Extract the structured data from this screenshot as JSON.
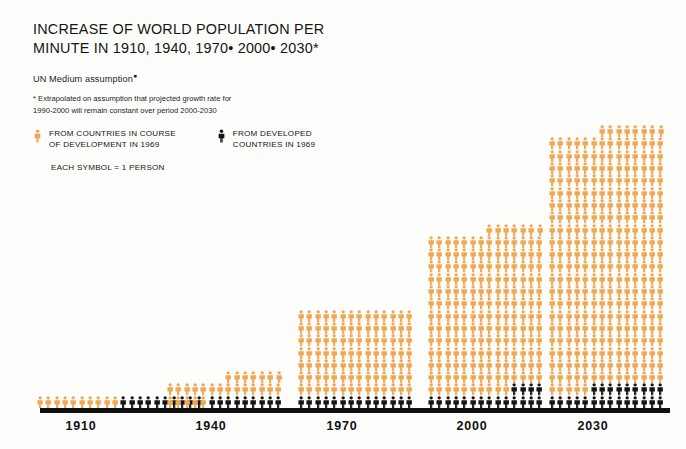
{
  "header": {
    "title": "INCREASE OF WORLD POPULATION PER\nMINUTE IN 1910, 1940, 1970• 2000• 2030*",
    "subtitle": "UN Medium assumption",
    "footnote_line1": "*  Extrapolated on assumption that projected growth rate for",
    "footnote_line2": "1990-2000 will remain constant over period 2000-2030"
  },
  "legend": {
    "developing": {
      "icon": "person-figure-orange-icon",
      "label": "FROM COUNTRIES IN COURSE\nOF DEVELOPMENT IN 1969",
      "color": "#F0A754"
    },
    "developed": {
      "icon": "person-figure-dark-icon",
      "label": "FROM DEVELOPED\nCOUNTRIES IN 1969",
      "color": "#141414"
    },
    "symbol_note": "EACH SYMBOL = 1 PERSON"
  },
  "chart_data": {
    "type": "bar",
    "xlabel": "",
    "ylabel": "PERSONS PER MINUTE (EACH SYMBOL = 1 PERSON)",
    "unit": "persons per minute",
    "symbol_value": 1,
    "categories": [
      "1910",
      "1940",
      "1970",
      "2000",
      "2030"
    ],
    "series": [
      {
        "name": "FROM COUNTRIES IN COURSE OF DEVELOPMENT IN 1969",
        "color": "#F0A754",
        "values": [
          10,
          40,
          98,
          175,
          287
        ]
      },
      {
        "name": "FROM DEVELOPED COUNTRIES IN 1969",
        "color": "#141414",
        "values": [
          10,
          9,
          14,
          18,
          24
        ]
      }
    ],
    "totals": [
      20,
      49,
      112,
      193,
      311
    ],
    "columns_per_group": [
      20,
      14,
      14,
      14,
      14
    ],
    "grid": false,
    "legend_position": "top-left",
    "groups": [
      {
        "label": "1910",
        "cols": 20,
        "rows": [
          {
            "orange": 10,
            "dark": 10,
            "offset": 0
          }
        ]
      },
      {
        "label": "1940",
        "cols": 14,
        "rows": [
          {
            "orange": 7,
            "dark": 0,
            "offset": 7
          },
          {
            "orange": 14,
            "dark": 0,
            "offset": 0
          },
          {
            "orange": 5,
            "dark": 9,
            "offset": 0
          }
        ]
      },
      {
        "label": "1970",
        "cols": 14,
        "rows": [
          {
            "orange": 14,
            "dark": 0,
            "offset": 0
          },
          {
            "orange": 14,
            "dark": 0,
            "offset": 0
          },
          {
            "orange": 14,
            "dark": 0,
            "offset": 0
          },
          {
            "orange": 14,
            "dark": 0,
            "offset": 0
          },
          {
            "orange": 14,
            "dark": 0,
            "offset": 0
          },
          {
            "orange": 14,
            "dark": 0,
            "offset": 0
          },
          {
            "orange": 14,
            "dark": 0,
            "offset": 0
          },
          {
            "orange": 0,
            "dark": 14,
            "offset": 0
          }
        ]
      },
      {
        "label": "2000",
        "cols": 14,
        "rows": [
          {
            "orange": 7,
            "dark": 0,
            "offset": 7
          },
          {
            "orange": 14,
            "dark": 0,
            "offset": 0
          },
          {
            "orange": 14,
            "dark": 0,
            "offset": 0
          },
          {
            "orange": 14,
            "dark": 0,
            "offset": 0
          },
          {
            "orange": 14,
            "dark": 0,
            "offset": 0
          },
          {
            "orange": 14,
            "dark": 0,
            "offset": 0
          },
          {
            "orange": 14,
            "dark": 0,
            "offset": 0
          },
          {
            "orange": 14,
            "dark": 0,
            "offset": 0
          },
          {
            "orange": 14,
            "dark": 0,
            "offset": 0
          },
          {
            "orange": 14,
            "dark": 0,
            "offset": 0
          },
          {
            "orange": 14,
            "dark": 0,
            "offset": 0
          },
          {
            "orange": 14,
            "dark": 0,
            "offset": 0
          },
          {
            "orange": 14,
            "dark": 0,
            "offset": 0
          },
          {
            "orange": 10,
            "dark": 4,
            "offset": 0
          },
          {
            "orange": 0,
            "dark": 14,
            "offset": 0
          }
        ]
      },
      {
        "label": "2030",
        "cols": 14,
        "rows": [
          {
            "orange": 8,
            "dark": 0,
            "offset": 6
          },
          {
            "orange": 14,
            "dark": 0,
            "offset": 0
          },
          {
            "orange": 14,
            "dark": 0,
            "offset": 0
          },
          {
            "orange": 14,
            "dark": 0,
            "offset": 0
          },
          {
            "orange": 14,
            "dark": 0,
            "offset": 0
          },
          {
            "orange": 14,
            "dark": 0,
            "offset": 0
          },
          {
            "orange": 14,
            "dark": 0,
            "offset": 0
          },
          {
            "orange": 14,
            "dark": 0,
            "offset": 0
          },
          {
            "orange": 14,
            "dark": 0,
            "offset": 0
          },
          {
            "orange": 14,
            "dark": 0,
            "offset": 0
          },
          {
            "orange": 14,
            "dark": 0,
            "offset": 0
          },
          {
            "orange": 14,
            "dark": 0,
            "offset": 0
          },
          {
            "orange": 14,
            "dark": 0,
            "offset": 0
          },
          {
            "orange": 14,
            "dark": 0,
            "offset": 0
          },
          {
            "orange": 14,
            "dark": 0,
            "offset": 0
          },
          {
            "orange": 14,
            "dark": 0,
            "offset": 0
          },
          {
            "orange": 14,
            "dark": 0,
            "offset": 0
          },
          {
            "orange": 14,
            "dark": 0,
            "offset": 0
          },
          {
            "orange": 14,
            "dark": 0,
            "offset": 0
          },
          {
            "orange": 14,
            "dark": 0,
            "offset": 0
          },
          {
            "orange": 14,
            "dark": 0,
            "offset": 0
          },
          {
            "orange": 5,
            "dark": 9,
            "offset": 0
          },
          {
            "orange": 0,
            "dark": 14,
            "offset": 0
          }
        ]
      }
    ],
    "group_left_px": [
      36,
      166,
      297,
      427,
      548
    ],
    "axis_label_left_px": [
      46,
      176,
      307,
      437,
      558
    ]
  },
  "colors": {
    "orange": "#F0A754",
    "dark": "#141414",
    "baseline": "#111111",
    "background": "#fdfdfb",
    "text": "#151515"
  }
}
